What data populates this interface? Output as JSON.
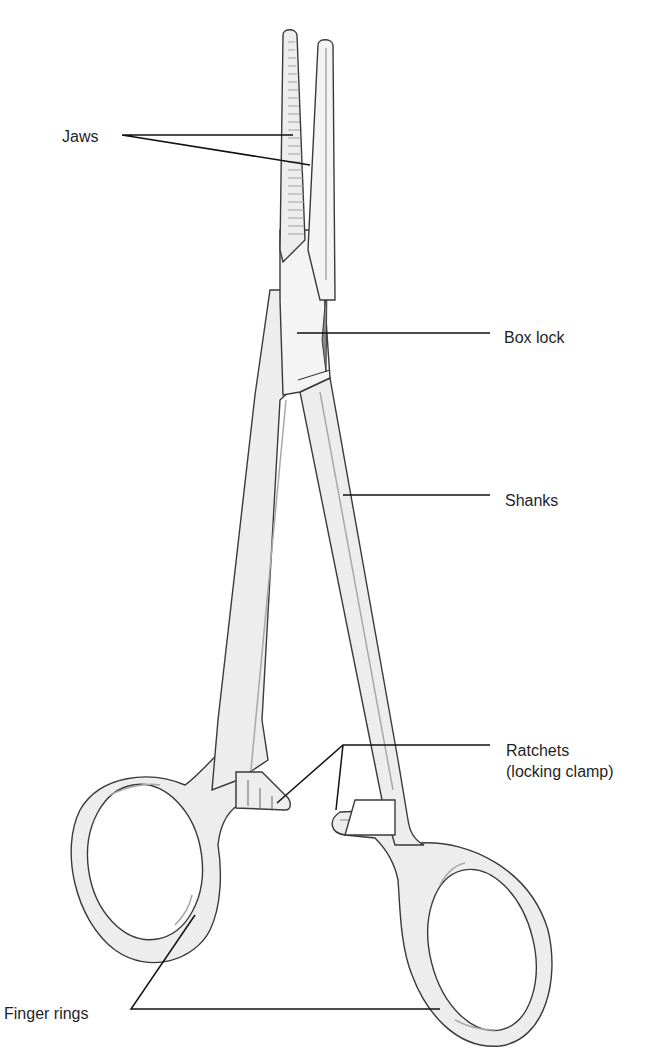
{
  "figure": {
    "colors": {
      "background": "#ffffff",
      "instrument_fill": "#ededed",
      "outline": "#3a3a3a",
      "leader_line": "#111111",
      "label_text": "#1f1f1f"
    }
  },
  "labels": {
    "jaws": "Jaws",
    "box_lock": "Box lock",
    "shanks": "Shanks",
    "ratchets_line1": "Ratchets",
    "ratchets_line2": "(locking clamp)",
    "finger_rings": "Finger rings"
  }
}
